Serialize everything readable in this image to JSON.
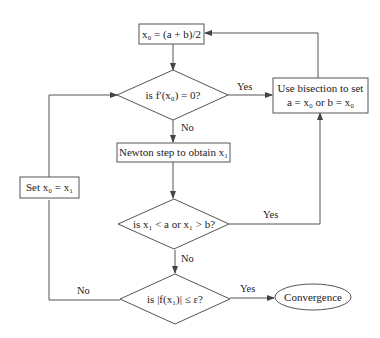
{
  "diagram": {
    "type": "flowchart",
    "nodes": {
      "init": {
        "kind": "process",
        "text": "x₀ = (a + b)/2"
      },
      "check_deriv": {
        "kind": "decision",
        "text": "is f′(x₀) = 0?"
      },
      "bisect": {
        "kind": "process",
        "line1": "Use bisection to set",
        "line2": "a = x₀ or b = x₀"
      },
      "newton": {
        "kind": "process",
        "text": "Newton step to obtain x₁"
      },
      "check_bounds": {
        "kind": "decision",
        "text": "is x₁ < a or x₁ > b?"
      },
      "check_conv": {
        "kind": "decision",
        "text": "is |f(x₁)| ≤ ε?"
      },
      "set_x0": {
        "kind": "process",
        "text": "Set x₀ = x₁"
      },
      "converge": {
        "kind": "terminal",
        "text": "Convergence"
      }
    },
    "edges": {
      "init_to_deriv": {
        "from": "init",
        "to": "check_deriv",
        "label": ""
      },
      "deriv_yes": {
        "from": "check_deriv",
        "to": "bisect",
        "label": "Yes"
      },
      "deriv_no": {
        "from": "check_deriv",
        "to": "newton",
        "label": "No"
      },
      "bisect_to_init": {
        "from": "bisect",
        "to": "init",
        "label": ""
      },
      "newton_to_bounds": {
        "from": "newton",
        "to": "check_bounds",
        "label": ""
      },
      "bounds_yes": {
        "from": "check_bounds",
        "to": "bisect",
        "label": "Yes"
      },
      "bounds_no": {
        "from": "check_bounds",
        "to": "check_conv",
        "label": "No"
      },
      "conv_yes": {
        "from": "check_conv",
        "to": "converge",
        "label": "Yes"
      },
      "conv_no": {
        "from": "check_conv",
        "to": "set_x0",
        "label": "No"
      },
      "setx0_to_deriv": {
        "from": "set_x0",
        "to": "check_deriv",
        "label": ""
      }
    }
  }
}
